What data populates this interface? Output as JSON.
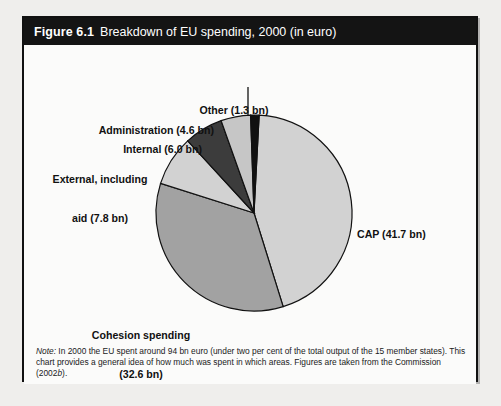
{
  "figure": {
    "number": "Figure 6.1",
    "title": "Breakdown of EU spending, 2000 (in euro)"
  },
  "note": {
    "label": "Note:",
    "body_part1": " In 2000 the EU spent around 94 bn euro (under two per cent of the total output of the 15 member states). This chart provides a general idea of how much was spent in which areas. Figures are taken from the Commission (2002",
    "body_italic": "b",
    "body_part2": ")."
  },
  "colors": {
    "title_bar": "#141414",
    "frame": "#111111",
    "background": "#fbfbfa",
    "cap": "#d2d2d2",
    "cohesion": "#a2a2a2",
    "external": "#d2d2d2",
    "internal": "#3c3c3c",
    "administration": "#c6c6c6",
    "other": "#111111",
    "slice_outline": "#111111"
  },
  "chart_data": {
    "type": "pie",
    "title": "Breakdown of EU spending, 2000 (in euro)",
    "unit": "bn euro",
    "total": 94,
    "legend_position": "callout-labels",
    "categories": [
      "CAP",
      "Cohesion spending",
      "External, including aid",
      "Internal",
      "Administration",
      "Other"
    ],
    "values": [
      41.7,
      32.6,
      7.8,
      6.0,
      4.6,
      1.3
    ],
    "labels": [
      "CAP (41.7 bn)",
      "Cohesion spending (32.6 bn)",
      "External, including aid (7.8 bn)",
      "Internal (6.0 bn)",
      "Administration (4.6 bn)",
      "Other (1.3 bn)"
    ],
    "slice_colors": [
      "#d2d2d2",
      "#a2a2a2",
      "#d2d2d2",
      "#3c3c3c",
      "#c6c6c6",
      "#111111"
    ]
  },
  "callouts": {
    "other": {
      "line1": "Other (1.3 bn)"
    },
    "administration": {
      "line1": "Administration (4.6 bn)"
    },
    "internal": {
      "line1": "Internal (6.0 bn)"
    },
    "external": {
      "line1": "External, including",
      "line2": "aid (7.8 bn)"
    },
    "cap": {
      "line1": "CAP (41.7 bn)"
    },
    "cohesion": {
      "line1": "Cohesion spending",
      "line2": "(32.6 bn)"
    }
  }
}
